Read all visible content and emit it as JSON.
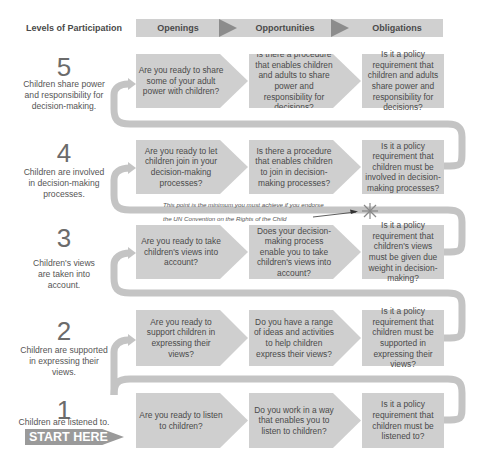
{
  "header": {
    "title": "Levels of Participation",
    "stages": [
      "Openings",
      "Opportunities",
      "Obligations"
    ]
  },
  "colors": {
    "box": "#cfcfcf",
    "header_bar": "#d0d0d0",
    "header_triangle": "#8c8c8c",
    "connector": "#c4c4c4",
    "start_here_bg": "#9a9a9a"
  },
  "levels": [
    {
      "number": "5",
      "description": "Children share power and responsibility for decision-making.",
      "openings": "Are you ready to share some of your adult power with children?",
      "opportunities": "Is there a procedure that enables children and adults to share power and responsibility for decisions?",
      "obligations": "Is it a policy requirement that children and adults share power and responsibility for decisions?"
    },
    {
      "number": "4",
      "description": "Children are involved in decision-making processes.",
      "openings": "Are you ready to let children join in your decision-making processes?",
      "opportunities": "Is there a procedure that enables children to join in decision-making processes?",
      "obligations": "Is it a policy requirement that children must be involved in decision-making processes?"
    },
    {
      "number": "3",
      "description": "Children's views are taken into account.",
      "openings": "Are you ready to take children's views into account?",
      "opportunities": "Does your decision-making process enable you to take children's views into account?",
      "obligations": "Is it a policy requirement that children's views must be given due weight in decision-making?"
    },
    {
      "number": "2",
      "description": "Children are supported in expressing their views.",
      "openings": "Are you ready to support children in expressing their views?",
      "opportunities": "Do you have a range of ideas and activities to help children express their views?",
      "obligations": "Is it a policy requirement that children must be supported in expressing their views?"
    },
    {
      "number": "1",
      "description": "Children are listened to.",
      "openings": "Are you ready to listen to children?",
      "opportunities": "Do you work in a way that enables you to listen to children?",
      "obligations": "Is it a policy requirement that children must be listened to?"
    }
  ],
  "annotation": {
    "line1": "This point is the minimum you must achieve if you endorse",
    "line2": "the UN Convention on the Rights of the Child"
  },
  "start_label": "START HERE"
}
